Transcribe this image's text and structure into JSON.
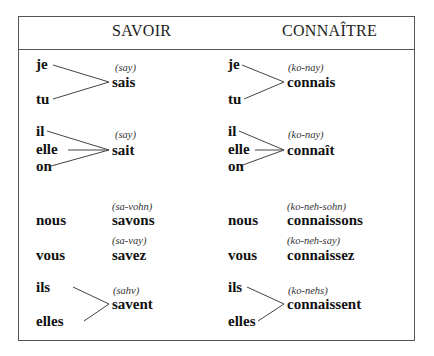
{
  "headers": {
    "savoir": "SAVOIR",
    "connaitre": "CONNAÎTRE"
  },
  "savoir": {
    "je_tu": {
      "pronouns": [
        "je",
        "tu"
      ],
      "verb": "sais",
      "pron": "(say)"
    },
    "il_elle_on": {
      "pronouns": [
        "il",
        "elle",
        "on"
      ],
      "verb": "sait",
      "pron": "(say)"
    },
    "nous": {
      "pronoun": "nous",
      "verb": "savons",
      "pron": "(sa-vohn)"
    },
    "vous": {
      "pronoun": "vous",
      "verb": "savez",
      "pron": "(sa-vay)"
    },
    "ils_elles": {
      "pronouns": [
        "ils",
        "elles"
      ],
      "verb": "savent",
      "pron": "(sahv)"
    }
  },
  "connaitre": {
    "je_tu": {
      "pronouns": [
        "je",
        "tu"
      ],
      "verb": "connais",
      "pron": "(ko-nay)"
    },
    "il_elle_on": {
      "pronouns": [
        "il",
        "elle",
        "on"
      ],
      "verb": "connaît",
      "pron": "(ko-nay)"
    },
    "nous": {
      "pronoun": "nous",
      "verb": "connaissons",
      "pron": "(ko-neh-sohn)"
    },
    "vous": {
      "pronoun": "vous",
      "verb": "connaissez",
      "pron": "(ko-neh-say)"
    },
    "ils_elles": {
      "pronouns": [
        "ils",
        "elles"
      ],
      "verb": "connaissent",
      "pron": "(ko-nehs)"
    }
  }
}
